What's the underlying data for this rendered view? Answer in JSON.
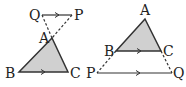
{
  "figure_left": {
    "labels": {
      "Q": "Q",
      "P": "P",
      "A": "A",
      "B": "B",
      "C": "C"
    }
  },
  "figure_right": {
    "labels": {
      "A": "A",
      "B": "B",
      "C": "C",
      "P": "P",
      "Q": "Q"
    }
  },
  "colors": {
    "fill": "#d0d0d0",
    "stroke": "#333333"
  }
}
